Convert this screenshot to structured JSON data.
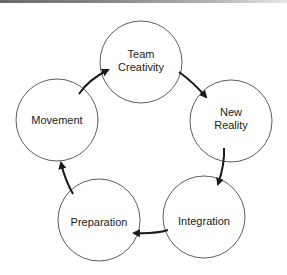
{
  "diagram": {
    "type": "cycle",
    "nodes": [
      {
        "id": "team-creativity",
        "lines": [
          "Team",
          "Creativity"
        ],
        "cx": 141,
        "cy": 62,
        "r": 41
      },
      {
        "id": "new-reality",
        "lines": [
          "New",
          "Reality"
        ],
        "cx": 231,
        "cy": 121,
        "r": 41
      },
      {
        "id": "integration",
        "lines": [
          "Integration"
        ],
        "cx": 204,
        "cy": 217,
        "r": 41
      },
      {
        "id": "preparation",
        "lines": [
          "Preparation"
        ],
        "cx": 99,
        "cy": 220,
        "r": 41
      },
      {
        "id": "movement",
        "lines": [
          "Movement"
        ],
        "cx": 57,
        "cy": 120,
        "r": 41
      }
    ],
    "edges": [
      {
        "from": "movement",
        "to": "team-creativity"
      },
      {
        "from": "team-creativity",
        "to": "new-reality"
      },
      {
        "from": "new-reality",
        "to": "integration"
      },
      {
        "from": "integration",
        "to": "preparation"
      },
      {
        "from": "preparation",
        "to": "movement"
      }
    ]
  }
}
